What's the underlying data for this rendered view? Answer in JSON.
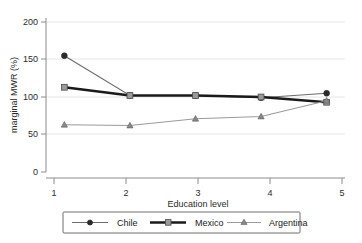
{
  "chart_data": {
    "type": "line",
    "title": "",
    "xlabel": "Education level",
    "ylabel": "marginal MWR (%)",
    "x": [
      1,
      2,
      3,
      4,
      5
    ],
    "xticklabels": [
      "1",
      "2",
      "3",
      "4",
      "5"
    ],
    "yticklabels": [
      "0",
      "50",
      "100",
      "150",
      "200"
    ],
    "yticks": [
      0,
      50,
      100,
      150,
      200
    ],
    "xlim": [
      0.72,
      5.28
    ],
    "ylim": [
      0,
      210
    ],
    "grid": "horizontal-light",
    "legend_position": "below-axes-center",
    "series": [
      {
        "name": "Chile",
        "values": [
          155,
          102,
          102,
          99,
          105
        ],
        "color": "#2a2a2a",
        "marker": "circle",
        "linewidth": "thin"
      },
      {
        "name": "Mexico",
        "values": [
          113,
          102,
          102,
          100,
          93
        ],
        "color": "#1a1a1a",
        "marker": "square",
        "linewidth": "thick"
      },
      {
        "name": "Argentina",
        "values": [
          63,
          62,
          71,
          74,
          95
        ],
        "color": "#8a8a8a",
        "marker": "triangle",
        "linewidth": "thin"
      }
    ]
  },
  "legend": {
    "entries": [
      {
        "label": "Chile"
      },
      {
        "label": "Mexico"
      },
      {
        "label": "Argentina"
      }
    ]
  }
}
